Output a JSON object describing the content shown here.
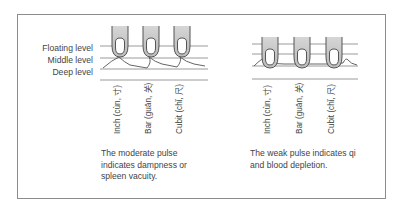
{
  "levels": {
    "floating": "Floating level",
    "middle": "Middle level",
    "deep": "Deep level"
  },
  "left_panel": {
    "positions": [
      "Inch (cùn, 寸)",
      "Bar (guān, 关)",
      "Cubit (chǐ, 尺)"
    ],
    "caption": "The moderate pulse indicates dampness or spleen vacuity."
  },
  "right_panel": {
    "positions": [
      "Inch (cùn, 寸)",
      "Bar (guān, 关)",
      "Cubit (chǐ, 尺)"
    ],
    "caption": "The weak pulse indicates qi and blood depletion."
  },
  "colors": {
    "line": "#9a9a9a",
    "finger_outline": "#555555",
    "finger_shade": "#c8c8c8",
    "frame": "#8c8c8c"
  }
}
